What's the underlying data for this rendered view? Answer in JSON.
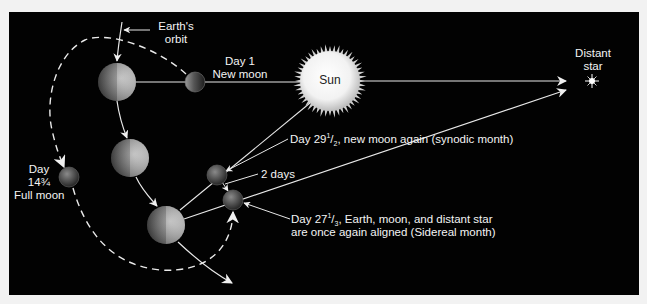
{
  "diagram": {
    "labels": {
      "earths_orbit_line1": "Earth's",
      "earths_orbit_line2": "orbit",
      "day1_line1": "Day 1",
      "day1_line2": "New moon",
      "sun": "Sun",
      "distant_star_line1": "Distant",
      "distant_star_line2": "star",
      "full_moon_line1": "Day",
      "full_moon_line2": "14¾",
      "full_moon_line3": "Full moon",
      "synodic_prefix": "Day 29",
      "synodic_num": "1",
      "synodic_den": "2",
      "synodic_suffix": ", new moon again (synodic month)",
      "two_days": "2 days",
      "sidereal_prefix": "Day 27",
      "sidereal_num": "1",
      "sidereal_den": "3",
      "sidereal_suffix": ", Earth, moon, and distant star",
      "sidereal_line2": "are once again aligned (Sidereal month)"
    },
    "colors": {
      "background": "#020202",
      "page": "#f2f2f2",
      "lines": "#e8e8e8",
      "text": "#f4f4f4",
      "sun_core": "#ffffff",
      "sun_edge": "#c8c8c8"
    },
    "objects": {
      "earths": [
        {
          "name": "earth-position-1",
          "cx": 117,
          "cy": 82,
          "r": 19
        },
        {
          "name": "earth-position-2",
          "cx": 130,
          "cy": 158,
          "r": 19
        },
        {
          "name": "earth-position-3",
          "cx": 166,
          "cy": 225,
          "r": 19
        }
      ],
      "moons": [
        {
          "name": "moon-day-1",
          "cx": 195,
          "cy": 82,
          "r": 10
        },
        {
          "name": "moon-day-14-75",
          "cx": 69,
          "cy": 177,
          "r": 10
        },
        {
          "name": "moon-day-29-5",
          "cx": 217,
          "cy": 175,
          "r": 10
        },
        {
          "name": "moon-day-27-33",
          "cx": 233,
          "cy": 200,
          "r": 10
        }
      ],
      "sun": {
        "cx": 330,
        "cy": 81,
        "r": 30
      },
      "star": {
        "cx": 592,
        "cy": 81
      }
    }
  }
}
